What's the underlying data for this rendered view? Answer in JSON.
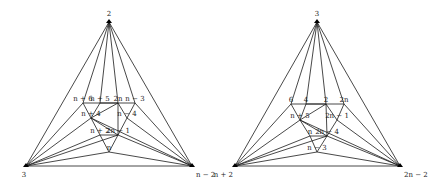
{
  "graphs": [
    {
      "id": "left",
      "outer": {
        "top": {
          "label": "2",
          "x": 109,
          "y": 22
        },
        "left": {
          "label": "3",
          "x": 26,
          "y": 166
        },
        "right": {
          "label": "n − 2",
          "x": 192,
          "y": 166
        }
      },
      "inner": [
        {
          "id": "a",
          "label": "n + 6",
          "x": 83,
          "y": 103
        },
        {
          "id": "b",
          "label": "n + 5",
          "x": 100,
          "y": 103
        },
        {
          "id": "c",
          "label": "2n",
          "x": 118,
          "y": 103
        },
        {
          "id": "d",
          "label": "n − 3",
          "x": 135,
          "y": 103
        },
        {
          "id": "e",
          "label": "n + 4",
          "x": 91,
          "y": 118
        },
        {
          "id": "f",
          "label": "n − 4",
          "x": 127,
          "y": 118
        },
        {
          "id": "g",
          "label": "n + 2",
          "x": 100,
          "y": 135
        },
        {
          "id": "h",
          "label": "2n − 1",
          "x": 118,
          "y": 135
        },
        {
          "id": "i",
          "label": "n",
          "x": 109,
          "y": 152
        }
      ]
    },
    {
      "id": "right",
      "outer": {
        "top": {
          "label": "3",
          "x": 317,
          "y": 22
        },
        "left": {
          "label": "n + 2",
          "x": 235,
          "y": 166
        },
        "right": {
          "label": "2n − 2",
          "x": 400,
          "y": 166
        }
      },
      "inner": [
        {
          "id": "a",
          "label": "6",
          "x": 291,
          "y": 104
        },
        {
          "id": "b",
          "label": "4",
          "x": 306,
          "y": 104
        },
        {
          "id": "c",
          "label": "2",
          "x": 326,
          "y": 104
        },
        {
          "id": "d",
          "label": "2n",
          "x": 344,
          "y": 104
        },
        {
          "id": "e",
          "label": "n + 5",
          "x": 300,
          "y": 120
        },
        {
          "id": "f",
          "label": "2n − 1",
          "x": 337,
          "y": 120
        },
        {
          "id": "g",
          "label": "n",
          "x": 310,
          "y": 136
        },
        {
          "id": "h",
          "label": "2n − 4",
          "x": 327,
          "y": 136
        },
        {
          "id": "i",
          "label": "n − 3",
          "x": 317,
          "y": 152
        }
      ]
    }
  ]
}
